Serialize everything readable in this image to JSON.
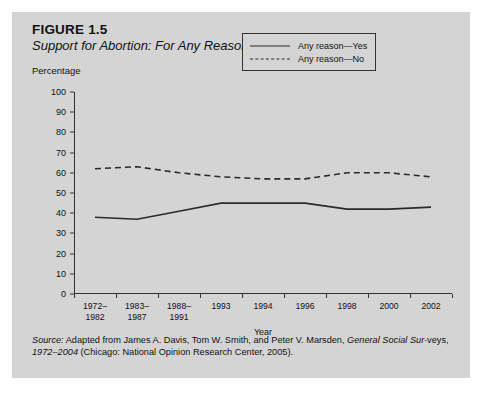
{
  "figure": {
    "number": "FIGURE 1.5",
    "title": "Support for Abortion: For Any Reason"
  },
  "source_note": {
    "label": "Source:",
    "text_1": " Adapted from James A. Davis, Tom W. Smith, and Peter V. Marsden, ",
    "italic_1": "General Social Sur-",
    "text_2": "veys, ",
    "italic_2": "1972–2004",
    "text_3": " (Chicago: National Opinion Research Center, 2005)."
  },
  "colors": {
    "panel_background": "#d4d4d4",
    "page_background": "#ffffff",
    "line": "#2a2a2a",
    "axis": "#333333",
    "text": "#111111"
  },
  "chart_data": {
    "type": "line",
    "title": "Support for Abortion: For Any Reason",
    "xlabel": "Year",
    "ylabel": "Percentage",
    "ylim": [
      0,
      100
    ],
    "yticks": [
      0,
      10,
      20,
      30,
      40,
      50,
      60,
      70,
      80,
      90,
      100
    ],
    "grid": false,
    "legend_position": "top-right",
    "categories": [
      "1972–1982",
      "1983–1987",
      "1988–1991",
      "1993",
      "1994",
      "1996",
      "1998",
      "2000",
      "2002"
    ],
    "series": [
      {
        "name": "Any reason—Yes",
        "style": "solid",
        "values": [
          38,
          37,
          41,
          45,
          45,
          45,
          42,
          42,
          43
        ]
      },
      {
        "name": "Any reason—No",
        "style": "dashed",
        "values": [
          62,
          63,
          60,
          58,
          57,
          57,
          60,
          60,
          58
        ]
      }
    ]
  }
}
